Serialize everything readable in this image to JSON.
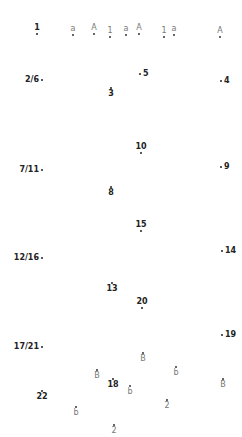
{
  "puzzle": {
    "type": "connect-the-dots",
    "numbered_points": [
      {
        "label": "1",
        "x": 37,
        "y": 34,
        "pos": "above"
      },
      {
        "label": "2/6",
        "x": 42,
        "y": 80,
        "pos": "left"
      },
      {
        "label": "3",
        "x": 111,
        "y": 88,
        "pos": "below"
      },
      {
        "label": "4",
        "x": 221,
        "y": 81,
        "pos": "right"
      },
      {
        "label": "5",
        "x": 140,
        "y": 74,
        "pos": "right"
      },
      {
        "label": "7/11",
        "x": 42,
        "y": 170,
        "pos": "left"
      },
      {
        "label": "8",
        "x": 111,
        "y": 187,
        "pos": "below"
      },
      {
        "label": "9",
        "x": 221,
        "y": 167,
        "pos": "right"
      },
      {
        "label": "10",
        "x": 141,
        "y": 153,
        "pos": "above"
      },
      {
        "label": "12/16",
        "x": 42,
        "y": 258,
        "pos": "left"
      },
      {
        "label": "13",
        "x": 112,
        "y": 283,
        "pos": "below"
      },
      {
        "label": "14",
        "x": 222,
        "y": 251,
        "pos": "right"
      },
      {
        "label": "15",
        "x": 141,
        "y": 231,
        "pos": "above"
      },
      {
        "label": "17/21",
        "x": 42,
        "y": 347,
        "pos": "left"
      },
      {
        "label": "18",
        "x": 113,
        "y": 379,
        "pos": "below"
      },
      {
        "label": "19",
        "x": 222,
        "y": 335,
        "pos": "right"
      },
      {
        "label": "20",
        "x": 142,
        "y": 308,
        "pos": "above"
      },
      {
        "label": "22",
        "x": 42,
        "y": 391,
        "pos": "below"
      }
    ],
    "letter_points": [
      {
        "label": "a",
        "x": 73,
        "y": 35,
        "pos": "above"
      },
      {
        "label": "A",
        "x": 94,
        "y": 34,
        "pos": "above"
      },
      {
        "label": "1",
        "x": 110,
        "y": 37,
        "pos": "above"
      },
      {
        "label": "a",
        "x": 126,
        "y": 35,
        "pos": "above"
      },
      {
        "label": "A",
        "x": 139,
        "y": 34,
        "pos": "above"
      },
      {
        "label": "1",
        "x": 164,
        "y": 37,
        "pos": "above"
      },
      {
        "label": "a",
        "x": 174,
        "y": 35,
        "pos": "above"
      },
      {
        "label": "A",
        "x": 220,
        "y": 37,
        "pos": "above"
      },
      {
        "label": "B",
        "x": 143,
        "y": 353,
        "pos": "below"
      },
      {
        "label": "b",
        "x": 176,
        "y": 367,
        "pos": "below"
      },
      {
        "label": "B",
        "x": 97,
        "y": 370,
        "pos": "below"
      },
      {
        "label": "b",
        "x": 130,
        "y": 386,
        "pos": "below"
      },
      {
        "label": "B",
        "x": 223,
        "y": 379,
        "pos": "below"
      },
      {
        "label": "2",
        "x": 167,
        "y": 400,
        "pos": "below"
      },
      {
        "label": "b",
        "x": 76,
        "y": 407,
        "pos": "below"
      },
      {
        "label": "2",
        "x": 114,
        "y": 425,
        "pos": "below"
      }
    ]
  }
}
